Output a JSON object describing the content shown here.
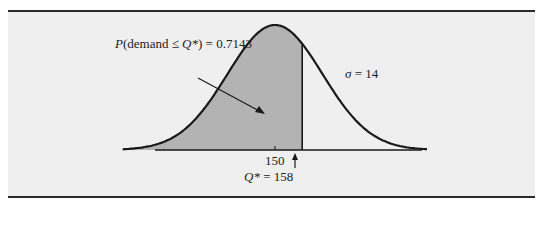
{
  "chart_data": {
    "type": "area",
    "title": "",
    "distribution": "normal",
    "mean": 150,
    "sigma": 14,
    "q_star": 158,
    "shaded_probability": 0.7143,
    "annotations": {
      "probability_label_prefix": "P",
      "probability_label_mid": "(demand ≤ ",
      "probability_label_var": "Q*",
      "probability_label_suffix": ") = 0.7143",
      "sigma_symbol": "σ",
      "sigma_value": " = 14",
      "mean_tick_label": "150",
      "qstar_var": "Q*",
      "qstar_value": " = 158"
    },
    "colors": {
      "shade": "#b3b3b3",
      "curve": "#1a1a1a",
      "background": "#efefef",
      "rule": "#2a2a2a"
    }
  }
}
